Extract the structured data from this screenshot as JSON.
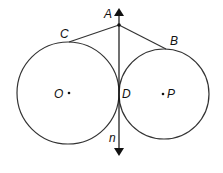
{
  "diagram": {
    "labels": {
      "A": "A",
      "B": "B",
      "C": "C",
      "D": "D",
      "O": "O",
      "P": "P",
      "n": "n"
    },
    "circles": [
      {
        "name": "O",
        "center_label": "O"
      },
      {
        "name": "P",
        "center_label": "P"
      }
    ],
    "segments": [
      {
        "from": "A",
        "to": "C"
      },
      {
        "from": "A",
        "to": "B"
      }
    ],
    "line": {
      "name": "n",
      "through": [
        "A",
        "D"
      ],
      "arrows": "both"
    },
    "colors": {
      "stroke": "#333333",
      "background": "#ffffff"
    }
  }
}
